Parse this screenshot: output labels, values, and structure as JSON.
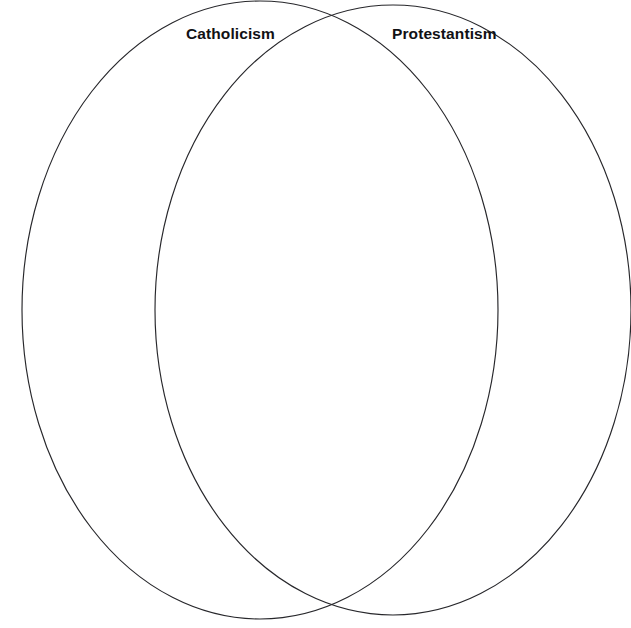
{
  "diagram": {
    "type": "venn-diagram",
    "background_color": "#ffffff",
    "stroke_color": "#27272b",
    "label_color": "#111114",
    "canvas": {
      "width": 631,
      "height": 628
    },
    "sets": [
      {
        "id": "catholicism",
        "label": "Catholicism",
        "side": "left",
        "center_x": 260,
        "center_y": 310,
        "radius_x": 238,
        "radius_y": 309,
        "label_x": 186,
        "label_y": 26,
        "items": []
      },
      {
        "id": "protestantism",
        "label": "Protestantism",
        "side": "right",
        "center_x": 393,
        "center_y": 310,
        "radius_x": 238,
        "radius_y": 305,
        "label_x": 392,
        "label_y": 26,
        "items": []
      }
    ],
    "intersection": {
      "id": "catholicism-protestantism-overlap",
      "items": []
    }
  }
}
